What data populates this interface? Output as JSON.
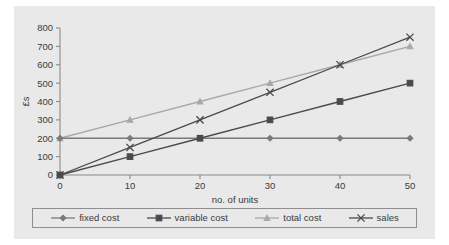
{
  "chart_data": {
    "type": "line",
    "title": "",
    "xlabel": "no. of units",
    "ylabel": "£s",
    "x": [
      0,
      10,
      20,
      30,
      40,
      50
    ],
    "xlim": [
      0,
      50
    ],
    "ylim": [
      0,
      800
    ],
    "xticks": [
      "0",
      "10",
      "20",
      "30",
      "40",
      "50"
    ],
    "yticks": [
      "0",
      "100",
      "200",
      "300",
      "400",
      "500",
      "600",
      "700",
      "800"
    ],
    "grid": false,
    "legend_position": "bottom",
    "series": [
      {
        "name": "fixed cost",
        "values": [
          200,
          200,
          200,
          200,
          200,
          200
        ],
        "color": "#7a7a7a",
        "marker": "diamond"
      },
      {
        "name": "variable cost",
        "values": [
          0,
          100,
          200,
          300,
          400,
          500
        ],
        "color": "#4a4a4a",
        "marker": "square"
      },
      {
        "name": "total cost",
        "values": [
          200,
          300,
          400,
          500,
          600,
          700
        ],
        "color": "#a8a8a8",
        "marker": "triangle"
      },
      {
        "name": "sales",
        "values": [
          0,
          150,
          300,
          450,
          600,
          750
        ],
        "color": "#4a4a4a",
        "marker": "cross"
      }
    ]
  },
  "axes": {
    "y_label": "£s",
    "x_label": "no. of units"
  },
  "legend": {
    "items": [
      {
        "label": "fixed cost",
        "marker": "diamond-marker",
        "color": "#7a7a7a"
      },
      {
        "label": "variable cost",
        "marker": "square-marker",
        "color": "#4a4a4a"
      },
      {
        "label": "total cost",
        "marker": "triangle-marker",
        "color": "#a8a8a8"
      },
      {
        "label": "sales",
        "marker": "cross-marker",
        "color": "#4a4a4a"
      }
    ]
  },
  "colors": {
    "chart_background": "#e9e9e9",
    "page_background": "#ffffff",
    "axis": "#8a8a8a",
    "text": "#3a3a3a",
    "legend_border": "#8f8f8f"
  }
}
